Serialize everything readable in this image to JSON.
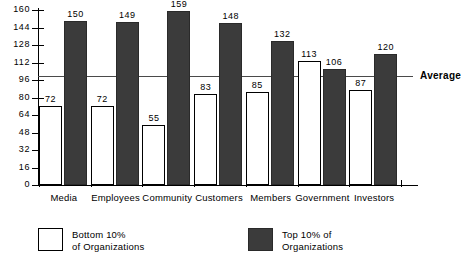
{
  "chart_data": {
    "type": "bar",
    "title": "",
    "subtitle": "",
    "xlabel": "",
    "ylabel": "",
    "ylim": [
      0,
      160
    ],
    "yticks": [
      0,
      16,
      32,
      48,
      64,
      80,
      96,
      112,
      128,
      144,
      160
    ],
    "grid": false,
    "legend_position": "bottom",
    "categories": [
      "Media",
      "Employees",
      "Community",
      "Customers",
      "Members",
      "Government",
      "Investors"
    ],
    "series": [
      {
        "name": "Bottom 10% of Organizations",
        "color": "#ffffff",
        "values": [
          72,
          72,
          55,
          83,
          85,
          113,
          87
        ]
      },
      {
        "name": "Top 10% of Organizations",
        "color": "#3b3b3b",
        "values": [
          150,
          149,
          159,
          148,
          132,
          106,
          120
        ]
      }
    ],
    "annotations": [
      {
        "label": "Average",
        "type": "hline",
        "value": 100
      }
    ]
  },
  "legend": {
    "items": [
      {
        "swatch": "light",
        "line1": "Bottom 10%",
        "line2": "of Organizations"
      },
      {
        "swatch": "dark",
        "line1": "Top 10% of",
        "line2": "Organizations"
      }
    ]
  }
}
